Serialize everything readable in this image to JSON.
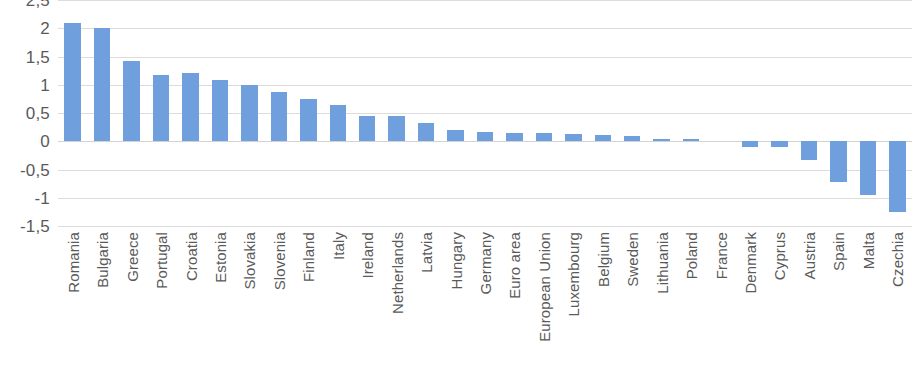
{
  "chart_data": {
    "type": "bar",
    "title": "",
    "subtitle": "",
    "xlabel": "",
    "ylabel": "",
    "ylim": [
      -1.5,
      2.5
    ],
    "ytick_labels": [
      "2,5",
      "2",
      "1,5",
      "1",
      "0,5",
      "0",
      "-0,5",
      "-1",
      "-1,5"
    ],
    "ytick_values": [
      2.5,
      2,
      1.5,
      1,
      0.5,
      0,
      -0.5,
      -1,
      -1.5
    ],
    "decimal_separator": ",",
    "grid": true,
    "legend": "none",
    "bar_color": "#6f9fdd",
    "gridline_color": "#dcdcdc",
    "categories": [
      "Romania",
      "Bulgaria",
      "Greece",
      "Portugal",
      "Croatia",
      "Estonia",
      "Slovakia",
      "Slovenia",
      "Finland",
      "Italy",
      "Ireland",
      "Netherlands",
      "Latvia",
      "Hungary",
      "Germany",
      "Euro area",
      "European Union",
      "Luxembourg",
      "Belgium",
      "Sweden",
      "Lithuania",
      "Poland",
      "France",
      "Denmark",
      "Cyprus",
      "Austria",
      "Spain",
      "Malta",
      "Czechia"
    ],
    "values": [
      2.1,
      2.0,
      1.42,
      1.17,
      1.2,
      1.08,
      1.0,
      0.87,
      0.74,
      0.64,
      0.44,
      0.45,
      0.33,
      0.2,
      0.16,
      0.15,
      0.14,
      0.12,
      0.11,
      0.1,
      0.04,
      0.04,
      0.0,
      -0.1,
      -0.1,
      -0.33,
      -0.72,
      -0.95,
      -1.25
    ]
  }
}
